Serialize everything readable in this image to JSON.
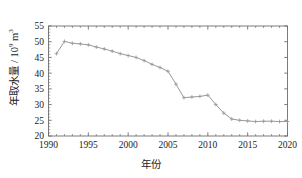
{
  "chart_data": {
    "type": "line",
    "title": "",
    "xlabel": "年份",
    "ylabel_main": "年取水量 / 10",
    "ylabel_sup": "9",
    "ylabel_unit": " m",
    "ylabel_unit_sup": "3",
    "ylabel_full": "年取水量 / 10⁹ m³",
    "xlim": [
      1990,
      2020
    ],
    "ylim": [
      20,
      55
    ],
    "xticks": [
      1990,
      1995,
      2000,
      2005,
      2010,
      2015,
      2020
    ],
    "xtick_labels": [
      "1990",
      "1995",
      "2000",
      "2005",
      "2010",
      "2015",
      "2020"
    ],
    "yticks": [
      20,
      25,
      30,
      35,
      40,
      45,
      50,
      55
    ],
    "ytick_labels": [
      "20",
      "25",
      "30",
      "35",
      "40",
      "45",
      "50",
      "55"
    ],
    "xminor_interval": 1,
    "grid": false,
    "legend": null,
    "line_color": "#9a9a9a",
    "marker": "plus",
    "marker_color": "#9a9a9a",
    "axis_color": "#6e6e6e",
    "series": [
      {
        "name": "年取水量",
        "x": [
          1991,
          1992,
          1993,
          1994,
          1995,
          1996,
          1997,
          1998,
          1999,
          2000,
          2001,
          2002,
          2003,
          2004,
          2005,
          2006,
          2007,
          2008,
          2009,
          2010,
          2011,
          2012,
          2013,
          2014,
          2015,
          2016,
          2017,
          2018,
          2019,
          2020
        ],
        "values": [
          46.2,
          50.1,
          49.5,
          49.3,
          49.0,
          48.3,
          47.7,
          47.0,
          46.2,
          45.6,
          45.0,
          44.0,
          42.8,
          41.8,
          40.6,
          36.5,
          32.2,
          32.4,
          32.6,
          33.0,
          30.0,
          27.3,
          25.4,
          25.0,
          24.8,
          24.6,
          24.7,
          24.7,
          24.6,
          24.6
        ]
      }
    ]
  }
}
